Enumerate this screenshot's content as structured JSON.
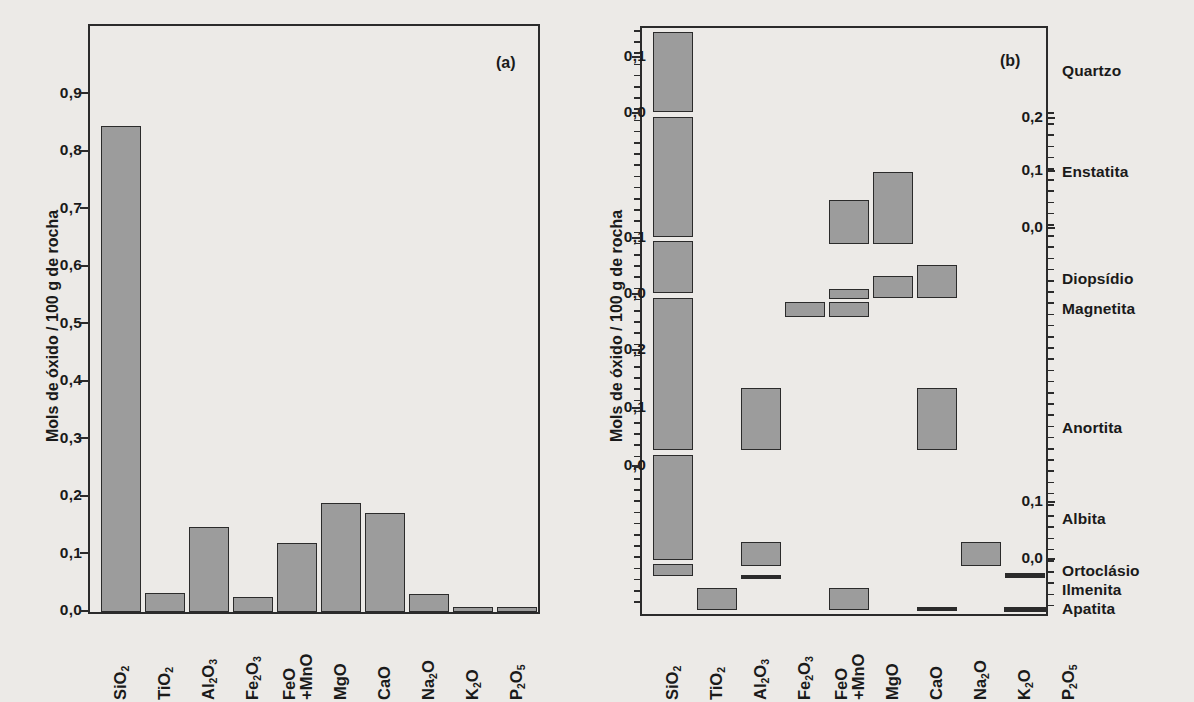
{
  "figure": {
    "background_color": "#eceae7",
    "bar_fill_color": "#9c9c9c",
    "line_color": "#2b2b2b"
  },
  "panel_a": {
    "tag": "(a)",
    "axis_title": "Mols de óxido / 100 g de rocha",
    "y_ticks": [
      "0,0",
      "0,1",
      "0,2",
      "0,3",
      "0,4",
      "0,5",
      "0,6",
      "0,7",
      "0,8",
      "0,9"
    ],
    "x_labels": [
      {
        "main": "SiO",
        "sub": "2",
        "line2": ""
      },
      {
        "main": "TiO",
        "sub": "2",
        "line2": ""
      },
      {
        "main": "Al",
        "sub": "2",
        "tail": "O",
        "tail_sub": "3",
        "line2": ""
      },
      {
        "main": "Fe",
        "sub": "2",
        "tail": "O",
        "tail_sub": "3",
        "line2": ""
      },
      {
        "main": "FeO",
        "sub": "",
        "line2": "+MnO"
      },
      {
        "main": "MgO",
        "sub": "",
        "line2": ""
      },
      {
        "main": "CaO",
        "sub": "",
        "line2": ""
      },
      {
        "main": "Na",
        "sub": "2",
        "tail": "O",
        "tail_sub": "",
        "line2": ""
      },
      {
        "main": "K",
        "sub": "2",
        "tail": "O",
        "tail_sub": "",
        "line2": ""
      },
      {
        "main": "P",
        "sub": "2",
        "tail": "O",
        "tail_sub": "5",
        "line2": ""
      }
    ]
  },
  "panel_b": {
    "tag": "(b)",
    "axis_title": "Mols de óxido / 100 g de rocha",
    "left_ticks": [
      "0,1",
      "0,0",
      "0,1",
      "0,0",
      "0,2",
      "0,1",
      "0,0"
    ],
    "right_ticks": [
      "0,2",
      "0,1",
      "0,0",
      "0,1",
      "0,0"
    ],
    "mineral_labels": [
      "Quartzo",
      "Enstatita",
      "Diopsídio",
      "Magnetita",
      "Anortita",
      "Albita",
      "Ortoclásio",
      "Ilmenita",
      "Apatita"
    ],
    "x_labels": [
      {
        "main": "SiO",
        "sub": "2",
        "line2": ""
      },
      {
        "main": "TiO",
        "sub": "2",
        "line2": ""
      },
      {
        "main": "Al",
        "sub": "2",
        "tail": "O",
        "tail_sub": "3",
        "line2": ""
      },
      {
        "main": "Fe",
        "sub": "2",
        "tail": "O",
        "tail_sub": "3",
        "line2": ""
      },
      {
        "main": "FeO",
        "sub": "",
        "line2": "+MnO"
      },
      {
        "main": "MgO",
        "sub": "",
        "line2": ""
      },
      {
        "main": "CaO",
        "sub": "",
        "line2": ""
      },
      {
        "main": "Na",
        "sub": "2",
        "tail": "O",
        "tail_sub": "",
        "line2": ""
      },
      {
        "main": "K",
        "sub": "2",
        "tail": "O",
        "tail_sub": "",
        "line2": ""
      },
      {
        "main": "P",
        "sub": "2",
        "tail": "O",
        "tail_sub": "5",
        "line2": ""
      }
    ]
  },
  "chart_data": [
    {
      "type": "bar",
      "panel": "(a)",
      "title": "",
      "xlabel": "",
      "ylabel": "Mols de óxido / 100 g de rocha",
      "ylim": [
        0.0,
        0.95
      ],
      "yticks": [
        0.0,
        0.1,
        0.2,
        0.3,
        0.4,
        0.5,
        0.6,
        0.7,
        0.8,
        0.9
      ],
      "grid": false,
      "legend": "none",
      "categories": [
        "SiO2",
        "TiO2",
        "Al2O3",
        "Fe2O3",
        "FeO+MnO",
        "MgO",
        "CaO",
        "Na2O",
        "K2O",
        "P2O5"
      ],
      "values": [
        0.845,
        0.032,
        0.147,
        0.026,
        0.121,
        0.189,
        0.173,
        0.031,
        0.005,
        0.005
      ]
    },
    {
      "type": "bar",
      "panel": "(b)",
      "title": "",
      "xlabel": "",
      "ylabel": "Mols de óxido / 100 g de rocha",
      "note": "Floating/stacked segment bars; each horizontal band corresponds to a normative mineral listed on the right axis. Values are segment spans in mols de óxido / 100 g de rocha.",
      "grid": false,
      "legend": "none",
      "categories": [
        "SiO2",
        "TiO2",
        "Al2O3",
        "Fe2O3",
        "FeO+MnO",
        "MgO",
        "CaO",
        "Na2O",
        "K2O",
        "P2O5"
      ],
      "minerals": [
        "Quartzo",
        "Enstatita",
        "Diopsídio",
        "Magnetita",
        "Anortita",
        "Albita",
        "Ortoclásio",
        "Ilmenita",
        "Apatita"
      ],
      "series": [
        {
          "name": "Quartzo",
          "values": [
            0.125,
            0,
            0,
            0,
            0,
            0,
            0,
            0,
            0,
            0
          ]
        },
        {
          "name": "Enstatita",
          "values": [
            0.185,
            0,
            0,
            0,
            0.065,
            0.155,
            0,
            0,
            0,
            0
          ]
        },
        {
          "name": "Diopsídio",
          "values": [
            0.072,
            0,
            0,
            0,
            0.017,
            0.04,
            0.048,
            0,
            0,
            0
          ]
        },
        {
          "name": "Magnetita",
          "values": [
            0,
            0,
            0,
            0.022,
            0.024,
            0,
            0,
            0,
            0,
            0
          ]
        },
        {
          "name": "Anortita",
          "values": [
            0.23,
            0,
            0.118,
            0,
            0,
            0,
            0.118,
            0,
            0,
            0
          ]
        },
        {
          "name": "Albita",
          "values": [
            0.16,
            0,
            0.04,
            0,
            0,
            0,
            0,
            0.035,
            0,
            0
          ]
        },
        {
          "name": "Ortoclásio",
          "values": [
            0.018,
            0,
            0.009,
            0,
            0,
            0,
            0,
            0,
            0.008,
            0
          ]
        },
        {
          "name": "Ilmenita",
          "values": [
            0,
            0.032,
            0,
            0,
            0.032,
            0,
            0,
            0,
            0,
            0
          ]
        },
        {
          "name": "Apatita",
          "values": [
            0,
            0,
            0,
            0,
            0,
            0,
            0.005,
            0,
            0,
            0.005
          ]
        }
      ]
    }
  ]
}
